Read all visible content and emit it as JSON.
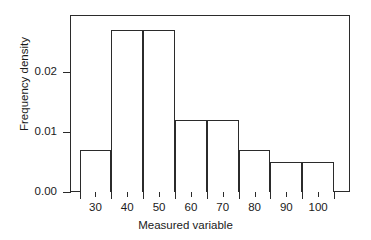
{
  "chart_data": {
    "type": "bar",
    "title": "",
    "subtitle": "",
    "xlabel": "Measured variable",
    "ylabel": "Frequency density",
    "categories": [
      "25-35",
      "35-45",
      "45-55",
      "55-65",
      "65-75",
      "75-85",
      "85-95",
      "95-105"
    ],
    "bin_edges": [
      25,
      35,
      45,
      55,
      65,
      75,
      85,
      95,
      105
    ],
    "values": [
      0.007,
      0.027,
      0.027,
      0.012,
      0.012,
      0.007,
      0.005,
      0.005
    ],
    "bin_width": 10,
    "xlim": [
      22,
      110
    ],
    "ylim": [
      0,
      0.0295
    ],
    "xticks": [
      30,
      40,
      50,
      60,
      70,
      80,
      90,
      100
    ],
    "xtick_labels": [
      "30",
      "40",
      "50",
      "60",
      "70",
      "80",
      "90",
      "100"
    ],
    "xticks_minor": [
      25,
      35,
      45,
      55,
      65,
      75,
      85,
      95,
      105
    ],
    "yticks": [
      0,
      0.01,
      0.02
    ],
    "ytick_labels": [
      "0.00",
      "0.01",
      "0.02"
    ],
    "grid": false,
    "legend": false,
    "bar_fill": "#ffffff",
    "bar_edge_color": "#2b2b2b",
    "frame_color": "#2b2b2b",
    "background": "#ffffff"
  },
  "axes": {
    "y_title": "Frequency density",
    "x_title": "Measured variable",
    "y_tick_labels": [
      "0.02",
      "0.01",
      "0.00"
    ],
    "x_tick_labels": [
      "30",
      "40",
      "50",
      "60",
      "70",
      "80",
      "90",
      "100"
    ]
  }
}
